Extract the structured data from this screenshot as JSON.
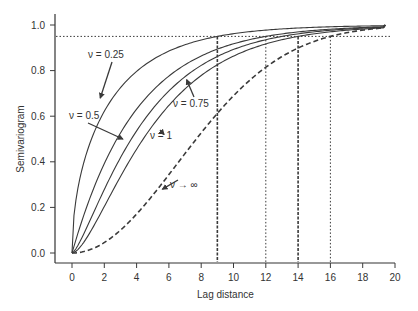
{
  "chart_data": {
    "type": "line",
    "title": "",
    "xlabel": "Lag distance",
    "ylabel": "Semivariogram",
    "xlim": [
      -1.5,
      20
    ],
    "ylim": [
      -0.04,
      1.05
    ],
    "x_ticks": [
      0,
      2,
      4,
      6,
      8,
      10,
      12,
      14,
      16,
      18,
      20
    ],
    "y_ticks": [
      "0.0",
      "0.2",
      "0.4",
      "0.6",
      "0.8",
      "1.0"
    ],
    "y_tick_values": [
      0.0,
      0.2,
      0.4,
      0.6,
      0.8,
      1.0
    ],
    "grid": false,
    "legend": "none (inline annotations with arrows)",
    "series": [
      {
        "name": "ν = 0.25",
        "nu": 0.25,
        "style": "solid",
        "practical_range": 9,
        "x": [
          0,
          1,
          2,
          4,
          6,
          9,
          12,
          16,
          19.4
        ],
        "y": [
          0,
          0.45,
          0.6,
          0.76,
          0.86,
          0.95,
          0.975,
          0.99,
          1.0
        ]
      },
      {
        "name": "ν = 0.5",
        "nu": 0.5,
        "style": "solid",
        "practical_range": 12,
        "x": [
          0,
          1,
          2,
          4,
          6,
          9,
          12,
          16,
          19.4
        ],
        "y": [
          0,
          0.22,
          0.39,
          0.63,
          0.78,
          0.9,
          0.95,
          0.98,
          1.0
        ]
      },
      {
        "name": "ν = 0.75",
        "nu": 0.75,
        "style": "solid",
        "practical_range": 13,
        "x": [
          0,
          1,
          2,
          4,
          6,
          9,
          12,
          16,
          19.4
        ],
        "y": [
          0,
          0.14,
          0.3,
          0.55,
          0.72,
          0.87,
          0.94,
          0.98,
          1.0
        ]
      },
      {
        "name": "ν = 1",
        "nu": 1,
        "style": "solid",
        "practical_range": 14,
        "x": [
          0,
          1,
          2,
          4,
          6,
          9,
          12,
          16,
          19.4
        ],
        "y": [
          0,
          0.1,
          0.25,
          0.49,
          0.67,
          0.84,
          0.92,
          0.97,
          1.0
        ]
      },
      {
        "name": "ν → ∞",
        "nu": "inf",
        "style": "dashed",
        "practical_range": 16,
        "x": [
          0,
          1,
          2,
          4,
          6,
          9,
          12,
          16,
          19.4
        ],
        "y": [
          0,
          0.01,
          0.05,
          0.18,
          0.36,
          0.61,
          0.8,
          0.95,
          1.0
        ]
      }
    ],
    "reference_lines": {
      "horizontal": {
        "y": 0.95,
        "style": "dotted"
      },
      "vertical": [
        {
          "x": 9,
          "style": "dash-dot"
        },
        {
          "x": 12,
          "style": "dotted"
        },
        {
          "x": 14,
          "style": "dash-dot"
        },
        {
          "x": 16,
          "style": "dotted"
        }
      ]
    },
    "annotations": [
      {
        "text": "ν = 0.25",
        "label_pos": [
          12,
          0.825
        ],
        "arrow_to": [
          1.75,
          0.68
        ]
      },
      {
        "text": "ν = 0.5",
        "label_pos": [
          2.0,
          0.6
        ],
        "arrow_to": [
          3.15,
          0.5
        ]
      },
      {
        "text": "ν = 0.75",
        "label_pos": [
          8.4,
          0.635
        ],
        "arrow_to": [
          7.1,
          0.76
        ]
      },
      {
        "text": "ν = 1",
        "label_pos": [
          6.5,
          0.415
        ],
        "arrow_to": [
          5.7,
          0.52
        ]
      },
      {
        "text": "ν → ∞",
        "label_pos": [
          6.5,
          0.2
        ],
        "arrow_to": [
          5.6,
          0.28
        ]
      }
    ]
  }
}
